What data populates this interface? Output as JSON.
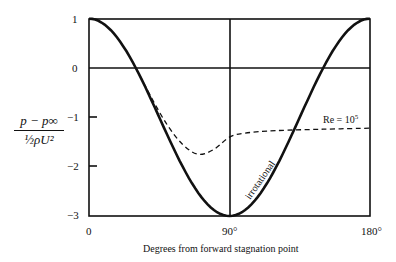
{
  "chart_data": {
    "type": "line",
    "title": "",
    "xlabel": "Degrees from forward stagnation point",
    "ylabel_num": "p − p∞",
    "ylabel_den": "½ρU²",
    "xlim": [
      0,
      180
    ],
    "ylim": [
      -3,
      1
    ],
    "x_ticks": [
      "0",
      "90°",
      "180°"
    ],
    "y_ticks": [
      "1",
      "0",
      "−1",
      "−2",
      "−3"
    ],
    "grid": false,
    "series": [
      {
        "name": "irrotational",
        "style": "solid",
        "x": [
          0,
          15,
          30,
          45,
          60,
          75,
          90,
          105,
          120,
          135,
          150,
          165,
          180
        ],
        "y": [
          1,
          0.73,
          0,
          -1,
          -2,
          -2.73,
          -3,
          -2.73,
          -2,
          -1,
          0,
          0.73,
          1
        ]
      },
      {
        "name": "Re = 10^5",
        "style": "dashed",
        "x": [
          30,
          40,
          50,
          60,
          70,
          80,
          90,
          100,
          120,
          150,
          180
        ],
        "y": [
          0,
          -0.6,
          -1.15,
          -1.55,
          -1.75,
          -1.65,
          -1.4,
          -1.32,
          -1.27,
          -1.24,
          -1.22
        ]
      }
    ],
    "annotations": [
      "irrotational",
      "Re = 10⁵"
    ]
  },
  "labels": {
    "xlabel": "Degrees from forward stagnation point",
    "x0": "0",
    "x90": "90°",
    "x180": "180°",
    "y1": "1",
    "y0": "0",
    "ym1": "−1",
    "ym2": "−2",
    "ym3": "−3",
    "irrot": "irrotational",
    "re_base": "Re = 10",
    "re_exp": "5",
    "ylab_num": "p − p∞",
    "ylab_den": "½ρU²"
  }
}
